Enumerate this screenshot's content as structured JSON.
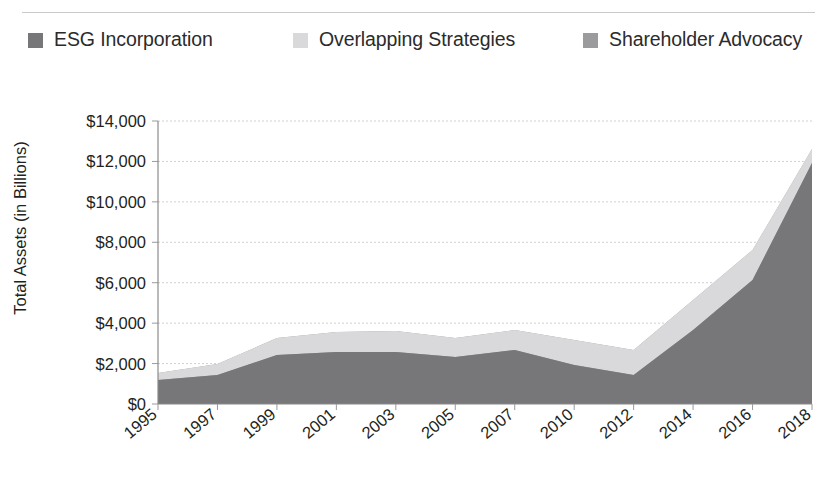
{
  "legend": {
    "items": [
      {
        "label": "ESG Incorporation",
        "color": "#77777a",
        "icon": "legend-swatch-icon"
      },
      {
        "label": "Overlapping Strategies",
        "color": "#d9d9dc",
        "icon": "legend-swatch-icon"
      },
      {
        "label": "Shareholder Advocacy",
        "color": "#9b9b9e",
        "icon": "legend-swatch-icon"
      }
    ]
  },
  "axes": {
    "ylabel": "Total Assets (in Billions)",
    "xlabel": "",
    "yticks": [
      "$0",
      "$2,000",
      "$4,000",
      "$6,000",
      "$8,000",
      "$10,000",
      "$12,000",
      "$14,000"
    ],
    "xticks": [
      "1995",
      "1997",
      "1999",
      "2001",
      "2003",
      "2005",
      "2007",
      "2010",
      "2012",
      "2014",
      "2016",
      "2018"
    ]
  },
  "chart_data": {
    "type": "area",
    "stacked": true,
    "title": "",
    "xlabel": "",
    "ylabel": "Total Assets (in Billions)",
    "ylim": [
      0,
      14000
    ],
    "ytick_values": [
      0,
      2000,
      4000,
      6000,
      8000,
      10000,
      12000,
      14000
    ],
    "grid": true,
    "legend_position": "top",
    "categories": [
      "1995",
      "1997",
      "1999",
      "2001",
      "2003",
      "2005",
      "2007",
      "2010",
      "2012",
      "2014",
      "2016",
      "2018"
    ],
    "series": [
      {
        "name": "ESG Incorporation",
        "color": "#77777a",
        "values": [
          162,
          529,
          1497,
          2010,
          2143,
          1685,
          2098,
          2545,
          1013,
          4800,
          8100,
          11995
        ]
      },
      {
        "name": "Overlapping Strategies",
        "color": "#d9d9dc",
        "values": [
          -84,
          -441,
          -1215,
          -1585,
          -1685,
          -1225,
          -1542,
          -981,
          -1012,
          -1652,
          -1963,
          -1992
        ]
      },
      {
        "name": "Shareholder Advocacy",
        "color": "#9b9b9e",
        "values": [
          561,
          736,
          922,
          897,
          906,
          703,
          739,
          1497,
          1536,
          1725,
          2500,
          1803
        ]
      }
    ],
    "stack_totals": [
      639,
      824,
      1204,
      1322,
      1364,
      1163,
      1295,
      3061,
      1537,
      4873,
      8637,
      11806
    ]
  },
  "plot_geometry": {
    "left": 158,
    "right": 812,
    "top": 121,
    "bottom": 404,
    "bands": {
      "esg": [
        380,
        375,
        355,
        352,
        352,
        357,
        350,
        365,
        375,
        330,
        280,
        163
      ],
      "overlap": [
        373,
        364,
        338,
        332,
        331,
        338,
        330,
        340,
        350,
        300,
        250,
        149
      ],
      "total": [
        391,
        387,
        362,
        358,
        358,
        363,
        357,
        372,
        382,
        340,
        287,
        166
      ]
    }
  }
}
